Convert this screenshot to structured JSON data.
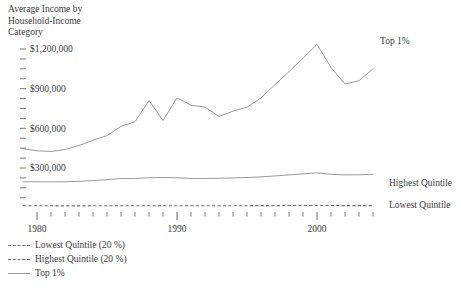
{
  "chart_data": {
    "type": "line",
    "title": "Average Income by Household-Income Category",
    "title_lines": [
      "Average Income by",
      "Household-Income",
      "Category"
    ],
    "xlabel": "",
    "ylabel": "",
    "xlim": [
      1979,
      2004
    ],
    "ylim": [
      0,
      1290000
    ],
    "grid": false,
    "legend_position": "below-left",
    "y_ticks": [
      {
        "value": 1200000,
        "label": "$1,200,000"
      },
      {
        "value": 1125000,
        "label": ""
      },
      {
        "value": 1050000,
        "label": ""
      },
      {
        "value": 975000,
        "label": ""
      },
      {
        "value": 900000,
        "label": "$900,000"
      },
      {
        "value": 825000,
        "label": ""
      },
      {
        "value": 750000,
        "label": ""
      },
      {
        "value": 675000,
        "label": ""
      },
      {
        "value": 600000,
        "label": "$600,000"
      },
      {
        "value": 525000,
        "label": ""
      },
      {
        "value": 450000,
        "label": ""
      },
      {
        "value": 375000,
        "label": ""
      },
      {
        "value": 300000,
        "label": "$300,000"
      },
      {
        "value": 225000,
        "label": ""
      },
      {
        "value": 150000,
        "label": ""
      },
      {
        "value": 75000,
        "label": ""
      }
    ],
    "x_ticks": [
      {
        "value": 1980,
        "label": "1980",
        "major": true
      },
      {
        "value": 1981,
        "label": "",
        "major": false
      },
      {
        "value": 1982,
        "label": "",
        "major": false
      },
      {
        "value": 1983,
        "label": "",
        "major": false
      },
      {
        "value": 1984,
        "label": "",
        "major": false
      },
      {
        "value": 1985,
        "label": "",
        "major": false
      },
      {
        "value": 1986,
        "label": "",
        "major": false
      },
      {
        "value": 1987,
        "label": "",
        "major": false
      },
      {
        "value": 1988,
        "label": "",
        "major": false
      },
      {
        "value": 1989,
        "label": "",
        "major": false
      },
      {
        "value": 1990,
        "label": "1990",
        "major": true
      },
      {
        "value": 1991,
        "label": "",
        "major": false
      },
      {
        "value": 1992,
        "label": "",
        "major": false
      },
      {
        "value": 1993,
        "label": "",
        "major": false
      },
      {
        "value": 1994,
        "label": "",
        "major": false
      },
      {
        "value": 1995,
        "label": "",
        "major": false
      },
      {
        "value": 1996,
        "label": "",
        "major": false
      },
      {
        "value": 1997,
        "label": "",
        "major": false
      },
      {
        "value": 1998,
        "label": "",
        "major": false
      },
      {
        "value": 1999,
        "label": "",
        "major": false
      },
      {
        "value": 2000,
        "label": "2000",
        "major": true
      },
      {
        "value": 2001,
        "label": "",
        "major": false
      },
      {
        "value": 2002,
        "label": "",
        "major": false
      },
      {
        "value": 2003,
        "label": "",
        "major": false
      },
      {
        "value": 2004,
        "label": "",
        "major": false
      }
    ],
    "x": [
      1979,
      1980,
      1981,
      1982,
      1983,
      1984,
      1985,
      1986,
      1987,
      1988,
      1989,
      1990,
      1991,
      1992,
      1993,
      1994,
      1995,
      1996,
      1997,
      1998,
      1999,
      2000,
      2001,
      2002,
      2003,
      2004
    ],
    "series": [
      {
        "name": "Top 1%",
        "style": "solid",
        "color": "#9b9b9b",
        "inline_label": "Top 1%",
        "values": [
          445000,
          430000,
          425000,
          440000,
          470000,
          510000,
          545000,
          615000,
          650000,
          810000,
          660000,
          830000,
          775000,
          760000,
          690000,
          730000,
          760000,
          830000,
          930000,
          1030000,
          1130000,
          1235000,
          1060000,
          935000,
          960000,
          1050000
        ]
      },
      {
        "name": "Highest Quintile (20 %)",
        "style": "solid",
        "color": "#9b9b9b",
        "inline_label": "Highest Quintile",
        "values": [
          196000,
          196000,
          195000,
          196000,
          199000,
          205000,
          212000,
          220000,
          221000,
          226000,
          228000,
          226000,
          221000,
          221000,
          222000,
          225000,
          228000,
          233000,
          240000,
          248000,
          256000,
          263000,
          252000,
          248000,
          249000,
          252000
        ]
      },
      {
        "name": "Lowest Quintile (20 %)",
        "style": "dashed",
        "color": "#6f6f6f",
        "inline_label": "Lowest Quintile",
        "values": [
          14500,
          14300,
          14000,
          13800,
          13800,
          14000,
          14200,
          14500,
          14700,
          14900,
          15100,
          14900,
          14600,
          14500,
          14400,
          14600,
          15000,
          15200,
          15600,
          16000,
          16300,
          16400,
          16000,
          15700,
          15600,
          15700
        ]
      }
    ],
    "inline_annotations": [
      {
        "text": "Top 1%",
        "x": 380,
        "y": 44
      },
      {
        "text": "Highest Quintile",
        "x": 389,
        "y": 186
      },
      {
        "text": "Lowest Quintile",
        "x": 389,
        "y": 208
      }
    ],
    "legend_entries": [
      {
        "label": "Lowest Quintile (20 %)",
        "style": "dashed"
      },
      {
        "label": "Highest Quintile (20 %)",
        "style": "dashed"
      },
      {
        "label": "Top 1%",
        "style": "solid"
      }
    ]
  }
}
